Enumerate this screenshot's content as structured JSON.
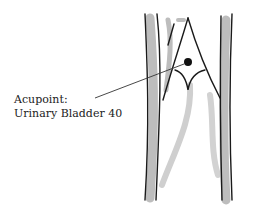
{
  "figure": {
    "label": {
      "line1": "Acupoint:",
      "line2": "Urinary Bladder 40"
    },
    "colors": {
      "ink": "#1a1a1a",
      "shade": "#b8b8b8",
      "background": "#ffffff"
    }
  }
}
